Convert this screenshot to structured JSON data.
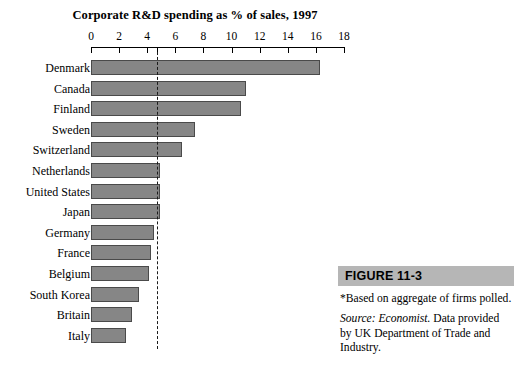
{
  "chart_data": {
    "type": "bar",
    "orientation": "horizontal",
    "title": "Corporate R&D spending as % of sales, 1997",
    "xlabel": "",
    "ylabel": "",
    "xlim": [
      0,
      18
    ],
    "xticks": [
      0,
      2,
      4,
      6,
      8,
      10,
      12,
      14,
      16,
      18
    ],
    "grid": false,
    "legend": null,
    "bar_color": "#868686",
    "bar_border_color": "#4a4a4a",
    "categories": [
      "Denmark",
      "Canada",
      "Finland",
      "Sweden",
      "Switzerland",
      "Netherlands",
      "United States",
      "Japan",
      "Germany",
      "France",
      "Belgium",
      "South Korea",
      "Britain",
      "Italy"
    ],
    "values": [
      16.3,
      11.0,
      10.7,
      7.4,
      6.5,
      4.9,
      4.9,
      4.9,
      4.5,
      4.3,
      4.1,
      3.4,
      2.9,
      2.5
    ],
    "annotations": [
      {
        "type": "reference-line",
        "name": "average-line",
        "value": 4.7,
        "style": "dashed",
        "color": "#1a1a1a"
      }
    ]
  },
  "figure": {
    "number_label": "FIGURE 11-3",
    "note": "*Based on aggregate of firms polled.",
    "source_prefix": "Source: Economist.",
    "source_rest": " Data provided by UK Department of Trade and Industry."
  }
}
